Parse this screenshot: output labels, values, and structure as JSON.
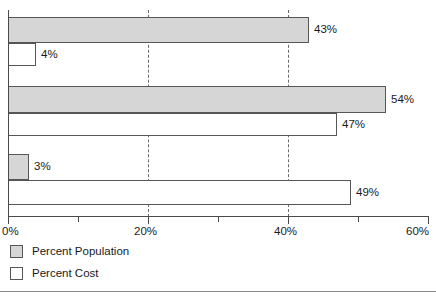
{
  "chart_data": {
    "type": "bar",
    "orientation": "horizontal",
    "title": "",
    "xlabel": "",
    "ylabel": "",
    "xlim": [
      0,
      60
    ],
    "xtick_labels": [
      "0%",
      "20%",
      "40%",
      "60%"
    ],
    "xtick_values": [
      0,
      20,
      40,
      60
    ],
    "minor_tick_values": [
      10,
      30,
      50
    ],
    "gridlines_at": [
      20,
      40
    ],
    "grid": "vertical-dashed",
    "categories": [
      "Group 1",
      "Group 2",
      "Group 3"
    ],
    "legend_position": "bottom-left",
    "series": [
      {
        "name": "Percent Population",
        "color": "#d6d6d6",
        "values": [
          43,
          54,
          3
        ],
        "value_labels": [
          "43%",
          "54%",
          "3%"
        ]
      },
      {
        "name": "Percent Cost",
        "color": "#ffffff",
        "values": [
          4,
          47,
          49
        ],
        "value_labels": [
          "4%",
          "47%",
          "49%"
        ]
      }
    ]
  },
  "axis": {
    "ticks": [
      {
        "label": "0%",
        "value": 0,
        "major": true
      },
      {
        "label": "",
        "value": 10,
        "major": false
      },
      {
        "label": "20%",
        "value": 20,
        "major": true
      },
      {
        "label": "",
        "value": 30,
        "major": false
      },
      {
        "label": "40%",
        "value": 40,
        "major": true
      },
      {
        "label": "",
        "value": 50,
        "major": false
      },
      {
        "label": "60%",
        "value": 60,
        "major": true
      }
    ]
  },
  "legend": {
    "items": [
      {
        "label": "Percent Population",
        "swatch": "pop"
      },
      {
        "label": "Percent Cost",
        "swatch": "cost"
      }
    ]
  },
  "bars": [
    {
      "series": "Percent Population",
      "group": 0,
      "value": 43,
      "label": "43%",
      "top": 17,
      "height": 26,
      "kind": "pop"
    },
    {
      "series": "Percent Cost",
      "group": 0,
      "value": 4,
      "label": "4%",
      "top": 43,
      "height": 23,
      "kind": "cost"
    },
    {
      "series": "Percent Population",
      "group": 1,
      "value": 54,
      "label": "54%",
      "top": 86,
      "height": 27,
      "kind": "pop"
    },
    {
      "series": "Percent Cost",
      "group": 1,
      "value": 47,
      "label": "47%",
      "top": 113,
      "height": 23,
      "kind": "cost"
    },
    {
      "series": "Percent Population",
      "group": 2,
      "value": 3,
      "label": "3%",
      "top": 154,
      "height": 26,
      "kind": "pop"
    },
    {
      "series": "Percent Cost",
      "group": 2,
      "value": 49,
      "label": "49%",
      "top": 180,
      "height": 25,
      "kind": "cost"
    }
  ],
  "geometry": {
    "origin_x": 8,
    "px_per_percent": 7.0
  },
  "colors": {
    "population_fill": "#d6d6d6",
    "cost_fill": "#ffffff",
    "bar_stroke": "#565656",
    "axis": "#4a4a4a",
    "grid": "#6b6b6b",
    "text": "#1a1a1a"
  }
}
